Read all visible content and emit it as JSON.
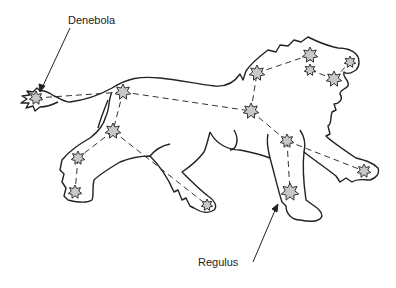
{
  "labels": {
    "denebola": "Denebola",
    "regulus": "Regulus"
  },
  "colors": {
    "outline": "#222222",
    "star_fill": "#c8c8c8",
    "star_stroke": "#333333",
    "background": "#ffffff"
  },
  "stars": [
    {
      "name": "denebola",
      "x": 36,
      "y": 98,
      "r": 7
    },
    {
      "name": "back",
      "x": 123,
      "y": 92,
      "r": 8
    },
    {
      "name": "hip",
      "x": 113,
      "y": 131,
      "r": 8
    },
    {
      "name": "hind-leg-upper",
      "x": 78,
      "y": 158,
      "r": 7
    },
    {
      "name": "hind-leg-lower",
      "x": 75,
      "y": 192,
      "r": 7
    },
    {
      "name": "hind-paw",
      "x": 207,
      "y": 205,
      "r": 6
    },
    {
      "name": "body-right",
      "x": 251,
      "y": 111,
      "r": 8
    },
    {
      "name": "mane",
      "x": 257,
      "y": 73,
      "r": 8
    },
    {
      "name": "head-top",
      "x": 310,
      "y": 55,
      "r": 8
    },
    {
      "name": "head-small",
      "x": 310,
      "y": 70,
      "r": 6
    },
    {
      "name": "muzzle",
      "x": 334,
      "y": 79,
      "r": 8
    },
    {
      "name": "face",
      "x": 350,
      "y": 62,
      "r": 6
    },
    {
      "name": "chest",
      "x": 287,
      "y": 141,
      "r": 7
    },
    {
      "name": "regulus",
      "x": 290,
      "y": 192,
      "r": 9
    },
    {
      "name": "front-paw",
      "x": 364,
      "y": 171,
      "r": 7
    }
  ]
}
